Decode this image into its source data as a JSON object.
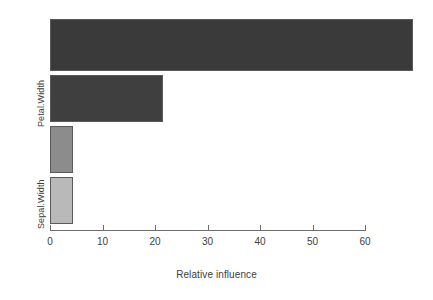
{
  "chart_data": {
    "type": "bar",
    "orientation": "horizontal",
    "title": "",
    "xlabel": "Relative influence",
    "ylabel": "",
    "categories": [
      "Petal.Length",
      "Petal.Width",
      "Sepal.Length",
      "Sepal.Width"
    ],
    "visible_category_labels": [
      "Petal.Width",
      "Sepal.Width"
    ],
    "values": [
      69.2,
      21.6,
      4.4,
      4.4
    ],
    "bar_colors": [
      "#3a3a3a",
      "#3f3f3f",
      "#8c8c8c",
      "#b9b9b9"
    ],
    "bar_border_color": "#5a5a5a",
    "xlim": [
      0,
      60
    ],
    "xticks": [
      0,
      10,
      20,
      30,
      40,
      50,
      60
    ],
    "xticklabels": [
      "0",
      "10",
      "20",
      "30",
      "40",
      "50",
      "60"
    ],
    "grid": false,
    "legend": false,
    "background": "#ffffff"
  },
  "axis": {
    "x_title": "Relative influence",
    "ticks": [
      {
        "label": "0",
        "value": 0
      },
      {
        "label": "10",
        "value": 10
      },
      {
        "label": "20",
        "value": 20
      },
      {
        "label": "30",
        "value": 30
      },
      {
        "label": "40",
        "value": 40
      },
      {
        "label": "50",
        "value": 50
      },
      {
        "label": "60",
        "value": 60
      }
    ]
  },
  "y_labels": [
    {
      "text": "Petal.Width"
    },
    {
      "text": "Sepal.Width"
    }
  ],
  "bars": [
    {
      "name": "bar-1",
      "value": 69.2,
      "color": "#3a3a3a"
    },
    {
      "name": "bar-2",
      "value": 21.6,
      "color": "#3f3f3f"
    },
    {
      "name": "bar-3",
      "value": 4.4,
      "color": "#8c8c8c"
    },
    {
      "name": "bar-4",
      "value": 4.4,
      "color": "#b9b9b9"
    }
  ]
}
